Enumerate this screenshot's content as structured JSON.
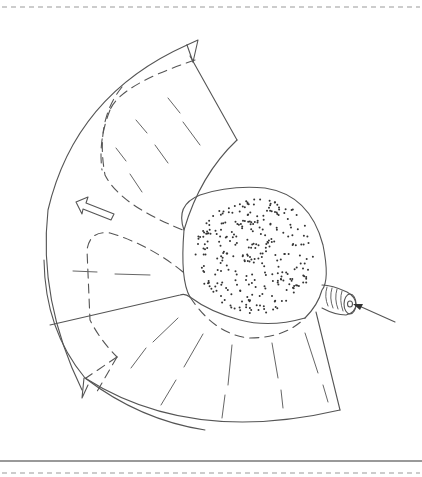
{
  "figure": {
    "type": "technical line drawing",
    "elements": [
      {
        "name": "balloon-sac",
        "style": "stippled"
      },
      {
        "name": "inflation-nozzle",
        "style": "ribbed"
      },
      {
        "name": "inflow-arrow",
        "style": "solid line with arrowhead"
      },
      {
        "name": "unfold-direction-arrow",
        "style": "hollow outline"
      },
      {
        "name": "fan-sheet",
        "style": "solid outline with dashed fold lines"
      }
    ],
    "colors": {
      "line": "#555555",
      "background": "#ffffff",
      "rule_dashed": "#9a9a9a",
      "rule_solid": "#777777"
    }
  },
  "frame": {
    "top_rule": "dashed",
    "bottom_rules": [
      "solid",
      "dashed"
    ]
  }
}
